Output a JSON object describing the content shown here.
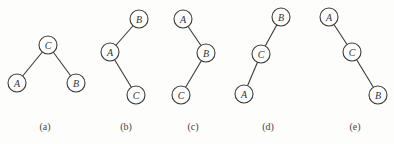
{
  "figure": {
    "node_radius": 9,
    "trees": [
      {
        "id": "a",
        "caption": "(a)",
        "caption_pos": [
          45,
          130
        ],
        "nodes": [
          {
            "label": "C",
            "x": 48,
            "y": 45
          },
          {
            "label": "A",
            "x": 17,
            "y": 83
          },
          {
            "label": "B",
            "x": 76,
            "y": 83
          }
        ],
        "edges": [
          [
            0,
            1
          ],
          [
            0,
            2
          ]
        ]
      },
      {
        "id": "b",
        "caption": "(b)",
        "caption_pos": [
          126,
          130
        ],
        "nodes": [
          {
            "label": "B",
            "x": 139,
            "y": 19
          },
          {
            "label": "A",
            "x": 110,
            "y": 52
          },
          {
            "label": "C",
            "x": 136,
            "y": 95
          }
        ],
        "edges": [
          [
            0,
            1
          ],
          [
            1,
            2
          ]
        ]
      },
      {
        "id": "c",
        "caption": "(c)",
        "caption_pos": [
          193,
          130
        ],
        "nodes": [
          {
            "label": "A",
            "x": 183,
            "y": 19
          },
          {
            "label": "B",
            "x": 206,
            "y": 53
          },
          {
            "label": "C",
            "x": 181,
            "y": 95
          }
        ],
        "edges": [
          [
            0,
            1
          ],
          [
            1,
            2
          ]
        ]
      },
      {
        "id": "d",
        "caption": "(d)",
        "caption_pos": [
          268,
          130
        ],
        "nodes": [
          {
            "label": "B",
            "x": 281,
            "y": 17
          },
          {
            "label": "C",
            "x": 261,
            "y": 54
          },
          {
            "label": "A",
            "x": 244,
            "y": 94
          }
        ],
        "edges": [
          [
            0,
            1
          ],
          [
            1,
            2
          ]
        ]
      },
      {
        "id": "e",
        "caption": "(e)",
        "caption_pos": [
          355,
          130
        ],
        "nodes": [
          {
            "label": "A",
            "x": 329,
            "y": 17
          },
          {
            "label": "C",
            "x": 352,
            "y": 52
          },
          {
            "label": "B",
            "x": 378,
            "y": 95
          }
        ],
        "edges": [
          [
            0,
            1
          ],
          [
            1,
            2
          ]
        ]
      }
    ]
  }
}
